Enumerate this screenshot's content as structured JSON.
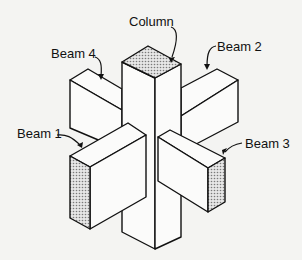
{
  "diagram": {
    "type": "isometric beam-column joint",
    "labels": {
      "column": "Column",
      "beam1": "Beam 1",
      "beam2": "Beam 2",
      "beam3": "Beam 3",
      "beam4": "Beam 4"
    },
    "colors": {
      "background": "#f4f4f2",
      "line": "#111111",
      "face_fill": "#fbfbfa",
      "hatch": "#8a8a8a"
    }
  }
}
